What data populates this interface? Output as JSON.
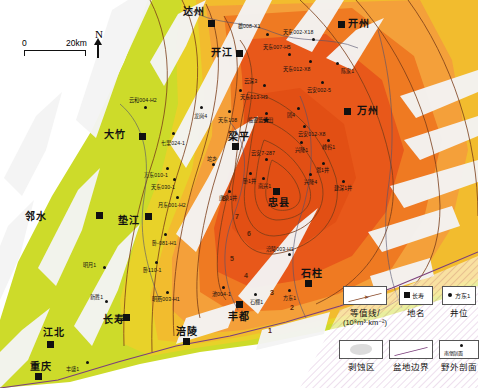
{
  "map": {
    "title": "",
    "scale_bar": {
      "zero": "0",
      "distance": "20km"
    },
    "north_arrow": {
      "label": "N"
    },
    "colors": {
      "core_red": "#e8581a",
      "orange": "#ef7a22",
      "light_orange": "#f4a03a",
      "amber": "#f2bc2e",
      "yellow": "#e8d229",
      "yellow_green": "#cddb2a",
      "denudation_white": "#f2f2f2",
      "contour_line": "#7a3c18",
      "basin_boundary": "#7b3f7b",
      "county_line": "#4a4a6a"
    },
    "contour_labels": [
      {
        "value": "8",
        "x": 222,
        "y": 195
      },
      {
        "value": "7",
        "x": 235,
        "y": 213
      },
      {
        "value": "6",
        "x": 247,
        "y": 230
      },
      {
        "value": "5",
        "x": 230,
        "y": 255
      },
      {
        "value": "4",
        "x": 244,
        "y": 272
      },
      {
        "value": "3",
        "x": 270,
        "y": 289
      },
      {
        "value": "2",
        "x": 290,
        "y": 304
      },
      {
        "value": "1",
        "x": 268,
        "y": 327
      }
    ],
    "cities": [
      {
        "name": "达州",
        "x": 183,
        "y": 7,
        "mx": 208,
        "my": 20
      },
      {
        "name": "开州",
        "x": 348,
        "y": 19,
        "mx": 338,
        "my": 21
      },
      {
        "name": "开江",
        "x": 211,
        "y": 48,
        "mx": 236,
        "my": 50
      },
      {
        "name": "万州",
        "x": 357,
        "y": 106,
        "mx": 344,
        "my": 108
      },
      {
        "name": "大竹",
        "x": 104,
        "y": 130,
        "mx": 139,
        "my": 133
      },
      {
        "name": "垫江",
        "x": 118,
        "y": 216,
        "mx": 145,
        "my": 213
      },
      {
        "name": "邻水",
        "x": 25,
        "y": 212,
        "mx": 96,
        "my": 212
      },
      {
        "name": "长寿",
        "x": 103,
        "y": 315,
        "mx": 123,
        "my": 314
      },
      {
        "name": "江北",
        "x": 43,
        "y": 328,
        "mx": 47,
        "my": 341
      },
      {
        "name": "重庆",
        "x": 30,
        "y": 362,
        "mx": 35,
        "my": 373
      },
      {
        "name": "涪陵",
        "x": 176,
        "y": 327,
        "mx": 183,
        "my": 338
      },
      {
        "name": "丰都",
        "x": 228,
        "y": 312,
        "mx": 236,
        "my": 301
      },
      {
        "name": "石柱",
        "x": 301,
        "y": 269,
        "mx": 305,
        "my": 280
      },
      {
        "name": "忠县",
        "x": 268,
        "y": 198,
        "mx": 273,
        "my": 188
      },
      {
        "name": "梁平",
        "x": 228,
        "y": 132,
        "mx": 232,
        "my": 143
      }
    ],
    "wells": [
      {
        "name": "雄008-X1",
        "lx": 238,
        "ly": 24,
        "px": 266,
        "py": 33
      },
      {
        "name": "天东002-X18",
        "lx": 283,
        "ly": 30,
        "px": 312,
        "py": 38
      },
      {
        "name": "天东007-H5",
        "lx": 263,
        "ly": 45,
        "px": 288,
        "py": 53
      },
      {
        "name": "天东012-X8",
        "lx": 283,
        "ly": 67,
        "px": 309,
        "py": 60
      },
      {
        "name": "陈家1",
        "lx": 341,
        "ly": 69,
        "px": 336,
        "py": 62
      },
      {
        "name": "云深3",
        "lx": 244,
        "ly": 79,
        "px": 263,
        "py": 84
      },
      {
        "name": "云安002-5",
        "lx": 307,
        "ly": 88,
        "px": 321,
        "py": 81
      },
      {
        "name": "天东013-H3",
        "lx": 240,
        "ly": 95,
        "px": 239,
        "py": 89
      },
      {
        "name": "云和004-H2",
        "lx": 129,
        "ly": 98,
        "px": 144,
        "py": 106
      },
      {
        "name": "龙岗4",
        "lx": 194,
        "ly": 114,
        "px": 200,
        "py": 106
      },
      {
        "name": "天东108",
        "lx": 218,
        "ly": 118,
        "px": 228,
        "py": 110
      },
      {
        "name": "临亚蓝组田",
        "lx": 248,
        "ly": 118,
        "px": 265,
        "py": 112
      },
      {
        "name": "团4",
        "lx": 287,
        "ly": 113,
        "px": 297,
        "py": 107
      },
      {
        "name": "七里024-1",
        "lx": 161,
        "ly": 141,
        "px": 172,
        "py": 132
      },
      {
        "name": "云安012-X8",
        "lx": 298,
        "ly": 132,
        "px": 303,
        "py": 125
      },
      {
        "name": "兴隆1",
        "lx": 295,
        "ly": 148,
        "px": 300,
        "py": 141
      },
      {
        "name": "峰谷1",
        "lx": 322,
        "ly": 145,
        "px": 327,
        "py": 139
      },
      {
        "name": "万东010-1",
        "lx": 144,
        "ly": 173,
        "px": 166,
        "py": 167
      },
      {
        "name": "坨乡",
        "lx": 207,
        "ly": 157,
        "px": 212,
        "py": 163
      },
      {
        "name": "云安7-287",
        "lx": 251,
        "ly": 151,
        "px": 265,
        "py": 158
      },
      {
        "name": "恩1井",
        "lx": 316,
        "ly": 168,
        "px": 322,
        "py": 162
      },
      {
        "name": "卧1井",
        "lx": 243,
        "ly": 179,
        "px": 249,
        "py": 172
      },
      {
        "name": "兴隆4",
        "lx": 304,
        "ly": 180,
        "px": 309,
        "py": 173
      },
      {
        "name": "南兴1",
        "lx": 258,
        "ly": 184,
        "px": 262,
        "py": 177
      },
      {
        "name": "建深1井",
        "lx": 334,
        "ly": 186,
        "px": 342,
        "py": 180
      },
      {
        "name": "月东001-H2",
        "lx": 158,
        "ly": 203,
        "px": 176,
        "py": 196
      },
      {
        "name": "唐泉1井",
        "lx": 219,
        "ly": 196,
        "px": 228,
        "py": 190
      },
      {
        "name": "天东030-1",
        "lx": 151,
        "ly": 185,
        "px": 173,
        "py": 178
      },
      {
        "name": "卧-081-H1",
        "lx": 152,
        "ly": 241,
        "px": 164,
        "py": 233
      },
      {
        "name": "明月1",
        "lx": 83,
        "ly": 263,
        "px": 103,
        "py": 266
      },
      {
        "name": "卧110-1",
        "lx": 143,
        "ly": 268,
        "px": 155,
        "py": 261
      },
      {
        "name": "涪陵003-H1",
        "lx": 266,
        "ly": 247,
        "px": 288,
        "py": 253
      },
      {
        "name": "明西003-H1",
        "lx": 152,
        "ly": 297,
        "px": 166,
        "py": 291
      },
      {
        "name": "新胜1",
        "lx": 90,
        "ly": 295,
        "px": 105,
        "py": 300
      },
      {
        "name": "池004-1",
        "lx": 212,
        "ly": 292,
        "px": 222,
        "py": 286
      },
      {
        "name": "石棚1",
        "lx": 250,
        "ly": 300,
        "px": 254,
        "py": 293
      },
      {
        "name": "方东1",
        "lx": 283,
        "ly": 296,
        "px": 288,
        "py": 289
      },
      {
        "name": "丰盛1",
        "lx": 66,
        "ly": 367,
        "px": 86,
        "py": 361
      }
    ],
    "legend": {
      "contour": {
        "caption": "等值线/",
        "unit": "(10⁸m³·km⁻²)",
        "icon": "contour-line-icon"
      },
      "place_name": {
        "caption": "地名",
        "sample": "长寿",
        "icon": "place-square-icon"
      },
      "well_position": {
        "caption": "井位",
        "sample": "方东1",
        "icon": "well-dot-icon"
      },
      "denudation": {
        "caption": "剥蚀区",
        "icon": "denudation-blob-icon"
      },
      "basin_boundary": {
        "caption": "盆地边界",
        "icon": "basin-boundary-icon"
      },
      "field_section": {
        "caption": "野外剖面",
        "sample": "南堡剖面",
        "icon": "field-section-icon"
      }
    }
  }
}
